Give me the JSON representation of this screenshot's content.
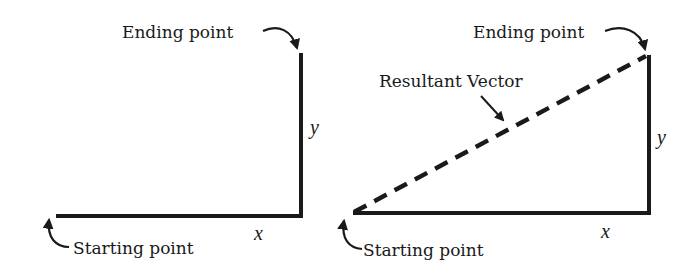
{
  "figure": {
    "panels": [
      {
        "id": "left",
        "ending_label": "Ending point",
        "starting_label": "Starting point",
        "x_label": "x",
        "y_label": "y"
      },
      {
        "id": "right",
        "ending_label": "Ending point",
        "starting_label": "Starting point",
        "resultant_label": "Resultant Vector",
        "x_label": "x",
        "y_label": "y"
      }
    ],
    "colors": {
      "line": "#1a1a1a",
      "background": "#ffffff"
    }
  }
}
